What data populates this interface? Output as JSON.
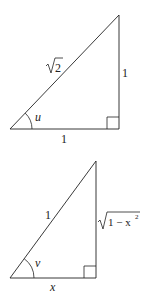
{
  "diagrams": [
    {
      "name": "triangle-u",
      "hypotenuse_label": "√2",
      "hypotenuse_radical": "√",
      "hypotenuse_radicand": "2",
      "vertical_label": "1",
      "base_label": "1",
      "angle_label": "u"
    },
    {
      "name": "triangle-v",
      "hypotenuse_label": "1",
      "vertical_label": "√(1 − x²)",
      "vertical_radical": "√",
      "vertical_radicand": "1 − x",
      "vertical_exponent": "2",
      "base_label": "x",
      "angle_label": "v"
    }
  ],
  "colors": {
    "line": "#222222",
    "background": "#ffffff"
  }
}
